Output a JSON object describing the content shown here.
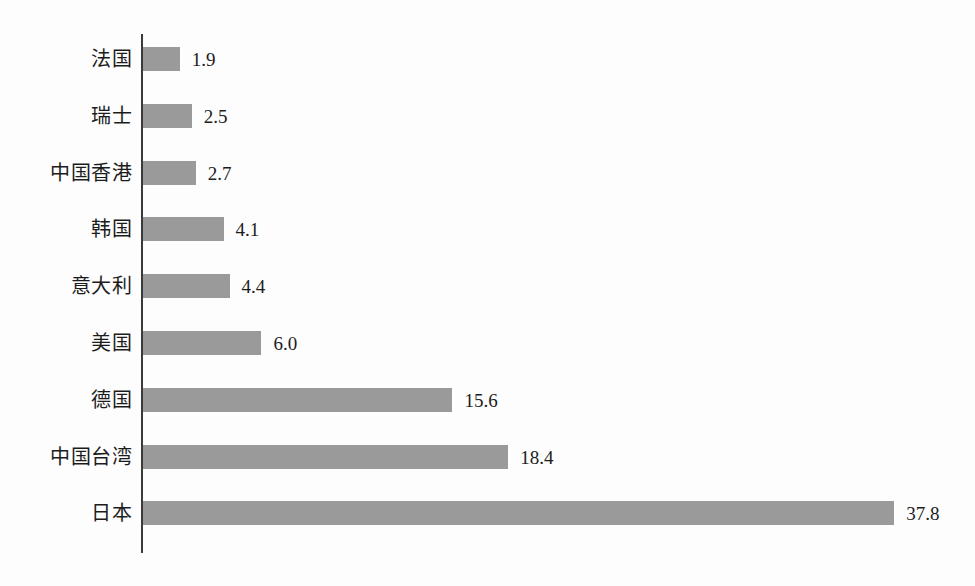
{
  "chart_data": {
    "type": "bar",
    "orientation": "horizontal",
    "title": "",
    "subtitle": "",
    "xlabel": "",
    "ylabel": "",
    "grid": false,
    "legend": false,
    "legend_position": "none",
    "xlim": [
      0,
      37.8
    ],
    "axis_line": "category axis at value 0, no tick marks, no tick labels",
    "bar_color": "#9a9a9a",
    "text_color": "#1c1c1c",
    "background_color": "#fdfdfd",
    "value_labels_shown": true,
    "categories": [
      "法国",
      "瑞士",
      "中国香港",
      "韩国",
      "意大利",
      "美国",
      "德国",
      "中国台湾",
      "日本"
    ],
    "values": [
      1.9,
      2.5,
      2.7,
      4.1,
      4.4,
      6.0,
      15.6,
      18.4,
      37.8
    ],
    "value_labels": [
      "1.9",
      "2.5",
      "2.7",
      "4.1",
      "4.4",
      "6.0",
      "15.6",
      "18.4",
      "37.8"
    ],
    "bars": [
      {
        "category": "法国",
        "value": 1.9,
        "label": "1.9"
      },
      {
        "category": "瑞士",
        "value": 2.5,
        "label": "2.5"
      },
      {
        "category": "中国香港",
        "value": 2.7,
        "label": "2.7"
      },
      {
        "category": "韩国",
        "value": 4.1,
        "label": "4.1"
      },
      {
        "category": "意大利",
        "value": 4.4,
        "label": "4.4"
      },
      {
        "category": "美国",
        "value": 6.0,
        "label": "6.0"
      },
      {
        "category": "德国",
        "value": 15.6,
        "label": "15.6"
      },
      {
        "category": "中国台湾",
        "value": 18.4,
        "label": "18.4"
      },
      {
        "category": "日本",
        "value": 37.8,
        "label": "37.8"
      }
    ]
  }
}
